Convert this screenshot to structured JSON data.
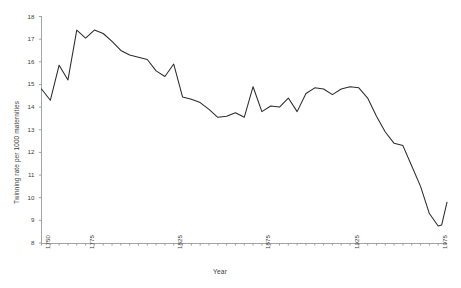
{
  "chart_data": {
    "type": "line",
    "title": "",
    "xlabel": "Year",
    "ylabel": "Twinning rate per 1000 maternities",
    "xlim": [
      1750,
      1975
    ],
    "ylim": [
      8,
      18
    ],
    "grid": false,
    "legend": null,
    "x_tick_labels": [
      "1750",
      "1775",
      "1825",
      "1875",
      "1925",
      "1975"
    ],
    "x_tick_values": [
      1750,
      1775,
      1825,
      1875,
      1925,
      1975
    ],
    "x_minor_tick_interval": 5,
    "y_tick_labels": [
      "8",
      "9",
      "10",
      "11",
      "12",
      "13",
      "14",
      "15",
      "16",
      "17",
      "18"
    ],
    "y_tick_values": [
      8,
      9,
      10,
      11,
      12,
      13,
      14,
      15,
      16,
      17,
      18
    ],
    "series": [
      {
        "name": "Twinning rate",
        "color": "#2b2b2b",
        "x": [
          1750,
          1755,
          1760,
          1765,
          1770,
          1775,
          1780,
          1785,
          1790,
          1795,
          1800,
          1805,
          1810,
          1815,
          1820,
          1825,
          1830,
          1835,
          1840,
          1845,
          1850,
          1855,
          1860,
          1865,
          1870,
          1875,
          1880,
          1885,
          1890,
          1895,
          1900,
          1905,
          1910,
          1915,
          1920,
          1925,
          1930,
          1935,
          1940,
          1945,
          1950,
          1955,
          1960,
          1965,
          1970,
          1975
        ],
        "values": [
          14.8,
          14.3,
          15.85,
          15.2,
          17.4,
          17.05,
          17.4,
          17.25,
          16.9,
          16.5,
          16.3,
          16.2,
          16.1,
          15.6,
          15.35,
          15.9,
          14.45,
          14.35,
          14.2,
          13.9,
          13.55,
          13.6,
          13.75,
          13.55,
          14.9,
          13.8,
          14.05,
          14.0,
          14.4,
          13.8,
          14.6,
          14.85,
          14.8,
          14.55,
          14.8,
          14.9,
          14.85,
          14.4,
          13.6,
          12.9,
          12.4,
          12.3,
          11.4,
          10.5,
          9.3,
          8.75
        ],
        "final_points": {
          "x": [
            1977,
            1980
          ],
          "values": [
            8.8,
            9.8
          ]
        }
      }
    ]
  },
  "axis": {
    "axis_color": "#808080",
    "line_color": "#2b2b2b",
    "tick_text_color": "#3b3b3b"
  }
}
